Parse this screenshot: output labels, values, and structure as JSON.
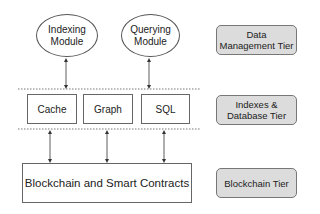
{
  "modules": [
    {
      "label_line1": "Indexing",
      "label_line2": "Module"
    },
    {
      "label_line1": "Querying",
      "label_line2": "Module"
    }
  ],
  "stores": [
    "Cache",
    "Graph",
    "SQL"
  ],
  "base": "Blockchain and Smart Contracts",
  "tiers": [
    {
      "line1": "Data",
      "line2": "Management Tier"
    },
    {
      "line1": "Indexes &",
      "line2": "Database Tier"
    },
    {
      "line1": "Blockchain Tier",
      "line2": ""
    }
  ],
  "colors": {
    "tier_fill": "#dcdcdc",
    "stroke": "#555555"
  }
}
